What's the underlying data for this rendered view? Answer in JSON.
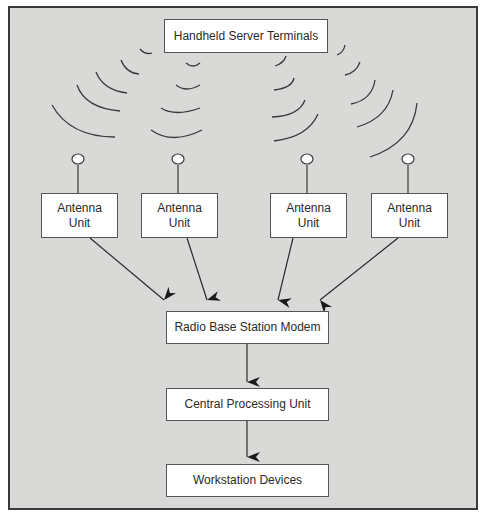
{
  "figure": {
    "caption_fragment": "... components of the ... configuration ..."
  },
  "nodes": {
    "terminals": {
      "label": "Handheld Server Terminals"
    },
    "antennas": [
      {
        "line1": "Antenna",
        "line2": "Unit"
      },
      {
        "line1": "Antenna",
        "line2": "Unit"
      },
      {
        "line1": "Antenna",
        "line2": "Unit"
      },
      {
        "line1": "Antenna",
        "line2": "Unit"
      }
    ],
    "modem": {
      "label": "Radio Base Station Modem"
    },
    "cpu": {
      "label": "Central Processing Unit"
    },
    "workstations": {
      "label": "Workstation Devices"
    }
  },
  "edges": [
    {
      "from": "Antenna Unit 1",
      "to": "Radio Base Station Modem"
    },
    {
      "from": "Antenna Unit 2",
      "to": "Radio Base Station Modem"
    },
    {
      "from": "Antenna Unit 3",
      "to": "Radio Base Station Modem"
    },
    {
      "from": "Antenna Unit 4",
      "to": "Radio Base Station Modem"
    },
    {
      "from": "Radio Base Station Modem",
      "to": "Central Processing Unit"
    },
    {
      "from": "Central Processing Unit",
      "to": "Workstation Devices"
    }
  ],
  "colors": {
    "background": "#d9d9d7",
    "box_fill": "#ffffff",
    "stroke": "#3a3a3a"
  }
}
